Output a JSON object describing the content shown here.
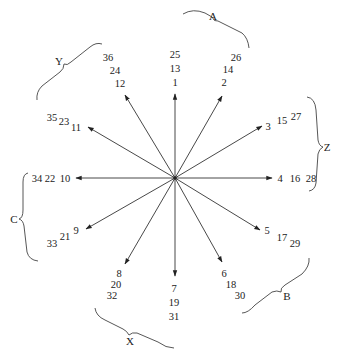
{
  "diagram": {
    "type": "radial-arrow-diagram",
    "center": [
      175,
      178
    ],
    "arrows": [
      {
        "id": 1,
        "tip": [
          175,
          93
        ],
        "labels": [
          {
            "t": "1",
            "x": 175,
            "y": 84
          },
          {
            "t": "13",
            "x": 175,
            "y": 71
          },
          {
            "t": "25",
            "x": 175,
            "y": 58
          }
        ]
      },
      {
        "id": 2,
        "tip": [
          222,
          95
        ],
        "labels": [
          {
            "t": "2",
            "x": 225,
            "y": 86
          },
          {
            "t": "14",
            "x": 229,
            "y": 73
          },
          {
            "t": "26",
            "x": 236,
            "y": 60
          }
        ]
      },
      {
        "id": 3,
        "tip": [
          262,
          125
        ],
        "labels": [
          {
            "t": "3",
            "x": 268,
            "y": 128
          },
          {
            "t": "15",
            "x": 282,
            "y": 122
          },
          {
            "t": "27",
            "x": 296,
            "y": 119
          }
        ]
      },
      {
        "id": 4,
        "tip": [
          272,
          178
        ],
        "labels": [
          {
            "t": "4",
            "x": 281,
            "y": 182
          },
          {
            "t": "16",
            "x": 296,
            "y": 182
          },
          {
            "t": "28",
            "x": 312,
            "y": 182
          }
        ]
      },
      {
        "id": 5,
        "tip": [
          260,
          230
        ],
        "labels": [
          {
            "t": "5",
            "x": 267,
            "y": 235
          },
          {
            "t": "17",
            "x": 282,
            "y": 241
          },
          {
            "t": "29",
            "x": 295,
            "y": 247
          }
        ]
      },
      {
        "id": 6,
        "tip": [
          222,
          263
        ],
        "labels": [
          {
            "t": "6",
            "x": 224,
            "y": 276
          },
          {
            "t": "18",
            "x": 231,
            "y": 288
          },
          {
            "t": "30",
            "x": 240,
            "y": 300
          }
        ]
      },
      {
        "id": 7,
        "tip": [
          175,
          277
        ],
        "labels": [
          {
            "t": "7",
            "x": 174,
            "y": 291
          },
          {
            "t": "19",
            "x": 174,
            "y": 305
          },
          {
            "t": "31",
            "x": 174,
            "y": 319
          }
        ]
      },
      {
        "id": 8,
        "tip": [
          125,
          265
        ],
        "labels": [
          {
            "t": "8",
            "x": 120,
            "y": 279
          },
          {
            "t": "20",
            "x": 117,
            "y": 290
          },
          {
            "t": "32",
            "x": 112,
            "y": 301
          }
        ]
      },
      {
        "id": 9,
        "tip": [
          86,
          229
        ],
        "labels": [
          {
            "t": "9",
            "x": 77,
            "y": 233
          },
          {
            "t": "21",
            "x": 65,
            "y": 240
          },
          {
            "t": "33",
            "x": 52,
            "y": 246
          }
        ]
      },
      {
        "id": 10,
        "tip": [
          75,
          178
        ],
        "labels": [
          {
            "t": "10",
            "x": 65,
            "y": 182
          },
          {
            "t": "22",
            "x": 49,
            "y": 182
          },
          {
            "t": "34",
            "x": 36,
            "y": 182
          }
        ]
      },
      {
        "id": 11,
        "tip": [
          87,
          126
        ],
        "labels": [
          {
            "t": "11",
            "x": 77,
            "y": 130
          },
          {
            "t": "23",
            "x": 64,
            "y": 124
          },
          {
            "t": "35",
            "x": 51,
            "y": 120
          }
        ]
      },
      {
        "id": 12,
        "tip": [
          125,
          94
        ],
        "labels": [
          {
            "t": "12",
            "x": 120,
            "y": 86
          },
          {
            "t": "24",
            "x": 115,
            "y": 73
          },
          {
            "t": "36",
            "x": 108,
            "y": 60
          }
        ]
      }
    ],
    "groups": [
      {
        "name": "A",
        "label_pos": [
          213,
          20
        ],
        "brace": "M 176 18 Q 200 10 212 26 Q 224 18 248 50"
      },
      {
        "name": "Z",
        "label_pos": [
          322,
          145
        ],
        "brace": "M 309 95 Q 319 100 316 140 Q 320 146 316 152 Q 319 185 309 190"
      },
      {
        "name": "B",
        "label_pos": [
          118,
          0
        ],
        "brace": "M 310 257 Q 300 285 282 289 Q 278 296 272 299 Q 260 315 245 313"
      },
      {
        "name": "X",
        "label_pos": [
          130,
          341
        ],
        "brace": "M 95 308 Q 100 322 123 330 Q 128 336 134 333 Q 156 334 174 352"
      },
      {
        "name": "C",
        "label_pos": [
          10,
          219
        ],
        "brace": "M 30 173 Q 22 175 25 210 Q 22 216 25 222 Q 28 255 38 260"
      },
      {
        "name": "Y",
        "label_pos": [
          58,
          63
        ],
        "brace": "M 102 43 Q 95 42 80 55 Q 72 62 66 65 Q 50 75 38 100"
      }
    ]
  },
  "group_labels": {
    "A": "A",
    "Z": "Z",
    "B": "B",
    "X": "X",
    "C": "C",
    "Y": "Y"
  },
  "arrow_labels": {
    "a1": [
      "1",
      "13",
      "25"
    ],
    "a2": [
      "2",
      "14",
      "26"
    ],
    "a3": [
      "3",
      "15",
      "27"
    ],
    "a4": [
      "4",
      "16",
      "28"
    ],
    "a5": [
      "5",
      "17",
      "29"
    ],
    "a6": [
      "6",
      "18",
      "30"
    ],
    "a7": [
      "7",
      "19",
      "31"
    ],
    "a8": [
      "8",
      "20",
      "32"
    ],
    "a9": [
      "9",
      "21",
      "33"
    ],
    "a10": [
      "10",
      "22",
      "34"
    ],
    "a11": [
      "11",
      "23",
      "35"
    ],
    "a12": [
      "12",
      "24",
      "36"
    ]
  }
}
